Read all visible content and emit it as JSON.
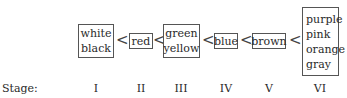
{
  "diagram": {
    "groups": [
      {
        "stage": "I",
        "colors": [
          "white",
          "black"
        ]
      },
      {
        "stage": "II",
        "colors": [
          "red"
        ]
      },
      {
        "stage": "III",
        "colors": [
          "green",
          "yellow"
        ]
      },
      {
        "stage": "IV",
        "colors": [
          "blue"
        ]
      },
      {
        "stage": "V",
        "colors": [
          "brown"
        ]
      },
      {
        "stage": "VI",
        "colors": [
          "purple",
          "pink",
          "orange",
          "gray"
        ]
      }
    ],
    "separator": "<",
    "stage_label": "Stage:"
  }
}
